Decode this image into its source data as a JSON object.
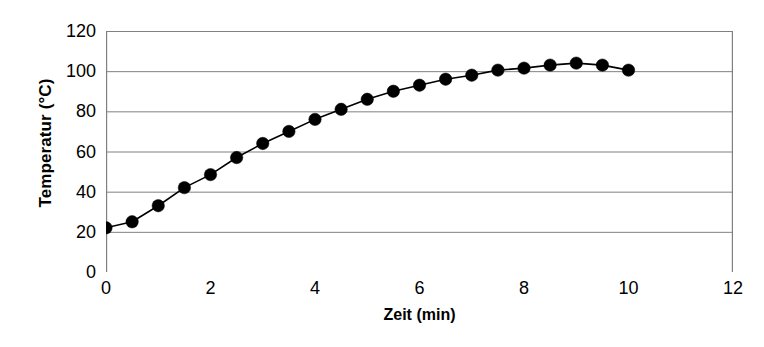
{
  "chart_data": {
    "type": "line",
    "title": "",
    "subtitle": "",
    "xlabel": "Zeit (min)",
    "ylabel": "Temperatur (°C)",
    "xlim": [
      0,
      12
    ],
    "ylim": [
      0,
      120
    ],
    "x_ticks": [
      0,
      2,
      4,
      6,
      8,
      10,
      12
    ],
    "x_tick_labels": [
      "0",
      "2",
      "4",
      "6",
      "8",
      "10",
      "12"
    ],
    "y_ticks": [
      0,
      20,
      40,
      60,
      80,
      100,
      120
    ],
    "y_tick_labels": [
      "0",
      "20",
      "40",
      "60",
      "80",
      "100",
      "120"
    ],
    "grid": "horizontal",
    "legend": "none",
    "marker": "filled-circle",
    "marker_color": "#000000",
    "line_color": "#000000",
    "gridline_color": "#808080",
    "axis_color": "#808080",
    "background": "#ffffff",
    "x": [
      0,
      0.5,
      1,
      1.5,
      2,
      2.5,
      3,
      3.5,
      4,
      4.5,
      5,
      5.5,
      6,
      6.5,
      7,
      7.5,
      8,
      8.5,
      9,
      9.5,
      10
    ],
    "values": [
      22,
      25,
      33,
      42,
      48.5,
      57,
      64,
      70,
      76,
      81,
      86,
      90,
      93,
      96,
      98,
      100.5,
      101.5,
      103,
      104,
      103,
      100.5
    ],
    "series": [
      {
        "name": "Temperatur",
        "x": [
          0,
          0.5,
          1,
          1.5,
          2,
          2.5,
          3,
          3.5,
          4,
          4.5,
          5,
          5.5,
          6,
          6.5,
          7,
          7.5,
          8,
          8.5,
          9,
          9.5,
          10
        ],
        "values": [
          22,
          25,
          33,
          42,
          48.5,
          57,
          64,
          70,
          76,
          81,
          86,
          90,
          93,
          96,
          98,
          100.5,
          101.5,
          103,
          104,
          103,
          100.5
        ]
      }
    ],
    "annotations": []
  }
}
